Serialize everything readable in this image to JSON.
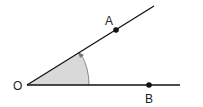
{
  "diagram": {
    "type": "angle",
    "labels": {
      "origin": "O",
      "point_a": "A",
      "point_b": "B"
    },
    "colors": {
      "line": "#111111",
      "sector_fill": "#d9d9d9",
      "arc": "#888888"
    }
  }
}
